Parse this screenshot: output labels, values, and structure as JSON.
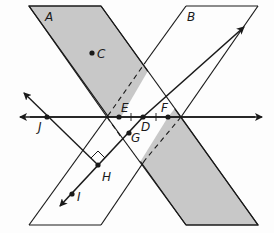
{
  "diagram": {
    "type": "geometry-planes-lines",
    "colors": {
      "plane_fill": "#c8c8c8",
      "stroke": "#1a1a1a",
      "background": "#fdfdfd"
    },
    "planes": [
      {
        "label": "A",
        "shaded": true
      },
      {
        "label": "B",
        "shaded": false
      }
    ],
    "points": [
      {
        "label": "C"
      },
      {
        "label": "D"
      },
      {
        "label": "E"
      },
      {
        "label": "F"
      },
      {
        "label": "G"
      },
      {
        "label": "H"
      },
      {
        "label": "I"
      },
      {
        "label": "J"
      }
    ],
    "lines": [
      {
        "name": "line-JF",
        "through": [
          "J",
          "E",
          "D",
          "F"
        ],
        "arrows": "both"
      },
      {
        "name": "line-DI",
        "through": [
          "D",
          "G",
          "H",
          "I"
        ],
        "arrows": "both"
      },
      {
        "name": "line-JH",
        "through": [
          "J",
          "H"
        ],
        "arrows": "one",
        "right_angle_at": "H"
      }
    ]
  }
}
